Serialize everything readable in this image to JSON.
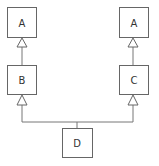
{
  "diagram": {
    "type": "inheritance",
    "nodes": [
      {
        "id": "a_left",
        "label": "A"
      },
      {
        "id": "b",
        "label": "B"
      },
      {
        "id": "a_right",
        "label": "A"
      },
      {
        "id": "c",
        "label": "C"
      },
      {
        "id": "d",
        "label": "D"
      }
    ],
    "edges": [
      {
        "from": "b",
        "to": "a_left",
        "arrow": "hollow-triangle"
      },
      {
        "from": "c",
        "to": "a_right",
        "arrow": "hollow-triangle"
      },
      {
        "from": "d",
        "to": "b",
        "arrow": "hollow-triangle"
      },
      {
        "from": "d",
        "to": "c",
        "arrow": "hollow-triangle"
      }
    ]
  }
}
